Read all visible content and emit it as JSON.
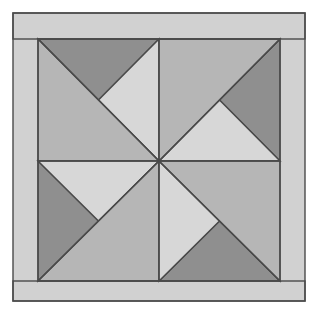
{
  "figure": {
    "canvas_width": 317,
    "canvas_height": 314,
    "background_color": "#ffffff"
  },
  "palette": {
    "dark_gray": "#8f8f8f",
    "medium_gray": "#b6b6b6",
    "light_gray": "#d7d7d7",
    "border_gray": "#d1d1d1",
    "outline": "#4a4a4a",
    "outline_width": 1.4
  },
  "frame": {
    "outer": {
      "x": 13,
      "y": 13,
      "width": 292,
      "height": 288,
      "fill_key": "border_gray"
    },
    "top_strip": {
      "x": 13,
      "y": 13,
      "width": 292,
      "height": 26,
      "fill_key": "border_gray"
    },
    "bottom_strip": {
      "x": 13,
      "y": 281,
      "width": 292,
      "height": 20,
      "fill_key": "border_gray"
    },
    "left_strip": {
      "x": 13,
      "y": 39,
      "width": 25,
      "height": 242,
      "fill_key": "border_gray"
    },
    "right_strip": {
      "x": 280,
      "y": 39,
      "width": 25,
      "height": 242,
      "fill_key": "border_gray"
    },
    "inner_block": {
      "x": 38,
      "y": 39,
      "width": 242,
      "height": 242
    }
  },
  "block": {
    "left": 38,
    "top": 39,
    "right": 280,
    "bottom": 281,
    "center_x": 159,
    "center_y": 161,
    "rotational_symmetry_degrees": 90,
    "quadrant_count": 4
  },
  "quadrants": [
    {
      "name": "top-left",
      "pieces": [
        {
          "name": "dark-triangle",
          "fill_key": "dark_gray",
          "points": "38,39 159,39 98.5,100"
        },
        {
          "name": "light-triangle",
          "fill_key": "light_gray",
          "points": "159,39 159,161 98.5,100"
        },
        {
          "name": "medium-field",
          "fill_key": "medium_gray",
          "points": "38,39 98.5,100 159,161 38,161"
        }
      ]
    },
    {
      "name": "top-right",
      "pieces": [
        {
          "name": "dark-triangle",
          "fill_key": "dark_gray",
          "points": "280,39 280,161 219.5,100"
        },
        {
          "name": "light-triangle",
          "fill_key": "light_gray",
          "points": "280,161 159,161 219.5,100"
        },
        {
          "name": "medium-field",
          "fill_key": "medium_gray",
          "points": "159,39 280,39 219.5,100 159,161"
        }
      ]
    },
    {
      "name": "bottom-left",
      "pieces": [
        {
          "name": "dark-triangle",
          "fill_key": "dark_gray",
          "points": "38,161 38,281 98.5,221"
        },
        {
          "name": "light-triangle",
          "fill_key": "light_gray",
          "points": "38,161 159,161 98.5,221"
        },
        {
          "name": "medium-field",
          "fill_key": "medium_gray",
          "points": "159,161 98.5,221 38,281 159,281"
        }
      ]
    },
    {
      "name": "bottom-right",
      "pieces": [
        {
          "name": "dark-triangle",
          "fill_key": "dark_gray",
          "points": "159,281 280,281 219.5,221"
        },
        {
          "name": "light-triangle",
          "fill_key": "light_gray",
          "points": "159,161 159,281 219.5,221"
        },
        {
          "name": "medium-field",
          "fill_key": "medium_gray",
          "points": "159,161 219.5,221 280,281 280,161"
        }
      ]
    }
  ],
  "guide_lines": [
    {
      "name": "vertical-center-line",
      "x1": 159,
      "y1": 39,
      "x2": 159,
      "y2": 281
    },
    {
      "name": "horizontal-center-line",
      "x1": 38,
      "y1": 161,
      "x2": 280,
      "y2": 161
    },
    {
      "name": "diagonal-top-left",
      "x1": 38,
      "y1": 39,
      "x2": 159,
      "y2": 161
    },
    {
      "name": "diagonal-top-right",
      "x1": 280,
      "y1": 39,
      "x2": 159,
      "y2": 161
    },
    {
      "name": "diagonal-bottom-left",
      "x1": 38,
      "y1": 281,
      "x2": 159,
      "y2": 161
    },
    {
      "name": "diagonal-bottom-right",
      "x1": 280,
      "y1": 281,
      "x2": 159,
      "y2": 161
    }
  ]
}
